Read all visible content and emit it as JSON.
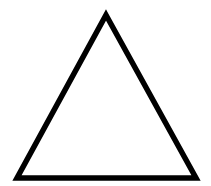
{
  "image": {
    "width": 211,
    "height": 186,
    "background_color": "#ffffff",
    "title": "",
    "caption": ""
  },
  "figure": {
    "name": "triangle",
    "shape_type": "triangle",
    "fill": "none",
    "stroke_color": "#000000",
    "stroke_width": 5.5,
    "stroke_linejoin": "miter",
    "stroke_linecap": "butt",
    "vertices": [
      {
        "name": "apex",
        "x": 106,
        "y": 15
      },
      {
        "name": "bottom-right",
        "x": 196,
        "y": 178
      },
      {
        "name": "bottom-left",
        "x": 17,
        "y": 178
      }
    ],
    "points_attr": "106,15 196,178 17,178",
    "edges": [
      {
        "name": "left-edge",
        "from": "apex",
        "to": "bottom-left"
      },
      {
        "name": "right-edge",
        "from": "apex",
        "to": "bottom-right"
      },
      {
        "name": "base-edge",
        "from": "bottom-left",
        "to": "bottom-right"
      }
    ]
  }
}
